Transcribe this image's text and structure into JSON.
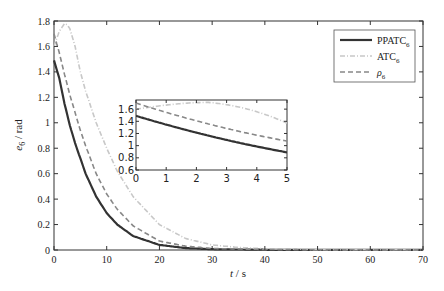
{
  "chart_data": {
    "type": "line",
    "title": "",
    "xlabel": "t / s",
    "ylabel": "e6 / rad",
    "xlim": [
      0,
      70
    ],
    "ylim": [
      0,
      1.8
    ],
    "x_ticks": [
      "0",
      "10",
      "20",
      "30",
      "40",
      "50",
      "60",
      "70"
    ],
    "y_ticks": [
      "0",
      "0.2",
      "0.4",
      "0.6",
      "0.8",
      "1",
      "1.2",
      "1.4",
      "1.6",
      "1.8"
    ],
    "grid": false,
    "legend_position": "upper right",
    "series": [
      {
        "name": "PPATC6",
        "style": "solid",
        "color": "#333333",
        "x": [
          0,
          1,
          2,
          3,
          4,
          5,
          6,
          8,
          10,
          12,
          15,
          20,
          25,
          30,
          40,
          50,
          60,
          70
        ],
        "y": [
          1.49,
          1.35,
          1.15,
          0.98,
          0.84,
          0.72,
          0.6,
          0.42,
          0.29,
          0.2,
          0.11,
          0.04,
          0.015,
          0.006,
          0.002,
          0.001,
          0.001,
          0.001
        ]
      },
      {
        "name": "ATC6",
        "style": "dash-dot",
        "color": "#c8c8c8",
        "x": [
          0,
          1,
          2,
          2.5,
          3,
          4,
          5,
          6,
          8,
          10,
          12,
          15,
          20,
          25,
          30,
          35,
          40,
          50,
          60,
          70
        ],
        "y": [
          1.6,
          1.72,
          1.78,
          1.77,
          1.74,
          1.6,
          1.4,
          1.25,
          1.0,
          0.8,
          0.62,
          0.42,
          0.2,
          0.09,
          0.04,
          0.02,
          0.01,
          0.003,
          0.002,
          0.001
        ]
      },
      {
        "name": "rho6",
        "style": "dashed",
        "color": "#888888",
        "x": [
          0,
          1,
          2,
          3,
          4,
          5,
          6,
          8,
          10,
          12,
          15,
          20,
          25,
          30,
          40,
          50,
          60,
          70
        ],
        "y": [
          1.7,
          1.55,
          1.38,
          1.22,
          1.08,
          0.94,
          0.82,
          0.6,
          0.44,
          0.32,
          0.19,
          0.07,
          0.03,
          0.012,
          0.004,
          0.002,
          0.001,
          0.001
        ]
      }
    ],
    "inset": {
      "xlim": [
        0,
        5
      ],
      "ylim": [
        0.6,
        1.75
      ],
      "x_ticks": [
        "0",
        "1",
        "2",
        "3",
        "4",
        "5"
      ],
      "y_ticks": [
        "0.6",
        "0.8",
        "1",
        "1.2",
        "1.4",
        "1.6"
      ]
    }
  },
  "labels": {
    "xlabel_t": "t",
    "xlabel_unit": " / s",
    "ylabel_e": "e",
    "ylabel_sub": "6",
    "ylabel_unit": " / rad"
  },
  "legend": [
    {
      "text": "PPATC",
      "sub": "6"
    },
    {
      "text": "ATC",
      "sub": "6"
    },
    {
      "text": "ρ",
      "sub": "6"
    }
  ]
}
